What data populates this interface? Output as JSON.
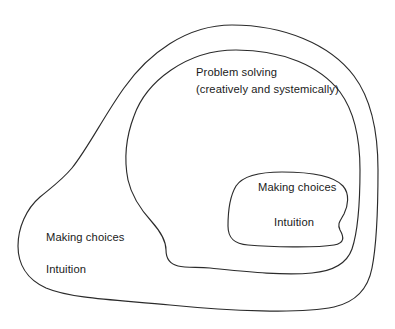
{
  "diagram": {
    "background_color": "#ffffff",
    "line_color": "#2b2b2b",
    "text_color": "#1a1a1a",
    "regions": [
      {
        "name": "outer-region",
        "labels": {
          "making_choices": "Making choices",
          "intuition": "Intuition"
        }
      },
      {
        "name": "middle-region",
        "labels": {
          "line1": "Problem solving",
          "line2": "(creatively and systemically)"
        }
      },
      {
        "name": "inner-region",
        "labels": {
          "making_choices": "Making choices",
          "intuition": "Intuition"
        }
      }
    ]
  }
}
